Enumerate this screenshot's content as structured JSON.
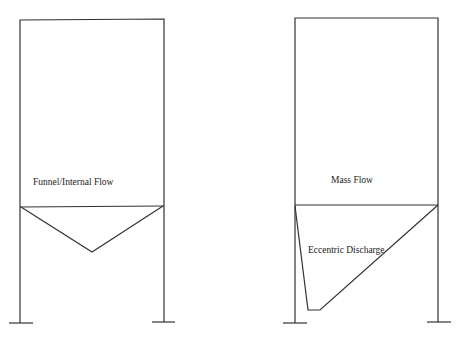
{
  "diagrams": [
    {
      "name": "funnel-internal-flow-silo",
      "label": "Funnel/Internal Flow",
      "hopper": "symmetric conical"
    },
    {
      "name": "mass-flow-silo",
      "label": "Mass Flow",
      "hopper_label": "Eccentric Discharge",
      "hopper": "eccentric"
    }
  ],
  "colors": {
    "line": "#333333",
    "background": "#ffffff"
  }
}
